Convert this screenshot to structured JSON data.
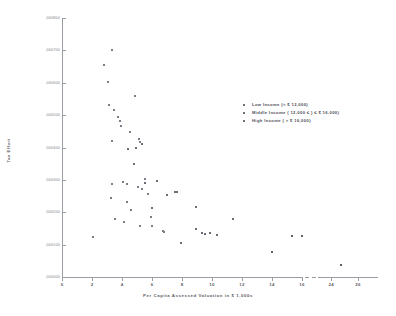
{
  "chart_data": {
    "type": "scatter",
    "title": "",
    "xlabel": "Per Capita Assessed Valuation in $ 1,000s",
    "ylabel": "Tax Effort",
    "xlim": [
      0,
      28
    ],
    "ylim": [
      0.0,
      0.0008
    ],
    "grid": false,
    "axis_break": {
      "from": 17,
      "to": 23,
      "note": "x-axis break between 16 and 24"
    },
    "xticks": [
      0,
      2,
      4,
      6,
      8,
      10,
      12,
      14,
      16,
      24,
      26
    ],
    "xtick_labels": [
      "0",
      "2",
      "4",
      "6",
      "8",
      "10",
      "12",
      "14",
      "16",
      "24",
      "26"
    ],
    "yticks": [
      0.0,
      0.0001,
      0.0002,
      0.0003,
      0.0004,
      0.0005,
      0.0006,
      0.0007,
      0.0008
    ],
    "ytick_labels": [
      ".000000",
      ".000100",
      ".000200",
      ".000300",
      ".000400",
      ".000500",
      ".000600",
      ".000700",
      ".000800"
    ],
    "legend_position": "upper right",
    "series": [
      {
        "name": "Low Income (< $ 12,000)",
        "key": "low",
        "marker": "dot",
        "color": "#7d7d88",
        "points": [
          [
            2.05,
            0.000124
          ],
          [
            2.8,
            0.000655
          ],
          [
            3.05,
            0.000602
          ],
          [
            3.3,
            0.0007
          ],
          [
            3.15,
            0.00053
          ],
          [
            3.45,
            0.000515
          ],
          [
            3.55,
            0.000178
          ],
          [
            3.35,
            0.00042
          ],
          [
            3.3,
            0.000287
          ],
          [
            3.25,
            0.000243
          ],
          [
            3.7,
            0.000495
          ],
          [
            3.95,
            0.000466
          ],
          [
            4.05,
            0.000292
          ],
          [
            4.1,
            0.00017
          ],
          [
            3.85,
            0.000482
          ],
          [
            4.35,
            0.000288
          ],
          [
            4.6,
            0.000208
          ],
          [
            4.35,
            0.000232
          ],
          [
            4.85,
            0.00056
          ],
          [
            4.55,
            0.000448
          ],
          [
            5.1,
            0.000425
          ],
          [
            5.2,
            0.000418
          ],
          [
            5.35,
            0.000272
          ],
          [
            5.05,
            0.000277
          ],
          [
            5.55,
            0.000303
          ],
          [
            5.2,
            0.000159
          ],
          [
            5.75,
            0.000256
          ],
          [
            5.95,
            0.000186
          ],
          [
            6.0,
            0.000157
          ],
          [
            6.7,
            0.000143
          ],
          [
            6.8,
            0.000139
          ]
        ]
      },
      {
        "name": "Middle Income ( 12,000 ≤ ) ≤ $ 16,000)",
        "key": "mid",
        "marker": "dot",
        "color": "#6d6d79",
        "points": [
          [
            4.4,
            0.000395
          ],
          [
            4.8,
            0.000348
          ],
          [
            4.95,
            0.0004
          ],
          [
            5.3,
            0.000412
          ],
          [
            5.55,
            0.000291
          ],
          [
            6.0,
            0.000214
          ],
          [
            6.35,
            0.000296
          ],
          [
            7.0,
            0.000252
          ],
          [
            7.55,
            0.000262
          ],
          [
            7.65,
            0.000263
          ],
          [
            7.9,
            0.000104
          ],
          [
            8.9,
            0.000216
          ],
          [
            8.95,
            0.000147
          ],
          [
            9.3,
            0.000135
          ],
          [
            9.55,
            0.000133
          ],
          [
            9.85,
            0.000136
          ],
          [
            10.35,
            0.00013
          ],
          [
            11.4,
            0.000178
          ]
        ]
      },
      {
        "name": "High Income ( > $ 16,000)",
        "key": "high",
        "marker": "dot",
        "color": "#5f5f6b",
        "points": [
          [
            14.0,
            7.7e-05
          ],
          [
            15.3,
            0.000126
          ],
          [
            16.0,
            0.000127
          ],
          [
            24.7,
            3.6e-05
          ]
        ]
      }
    ]
  },
  "legend": {
    "items": [
      {
        "label": "Low Income (< $ 12,000)"
      },
      {
        "label": "Middle Income ( 12,000 ≤ ) ≤ $ 16,000)"
      },
      {
        "label": "High Income ( > $ 16,000)"
      }
    ]
  }
}
